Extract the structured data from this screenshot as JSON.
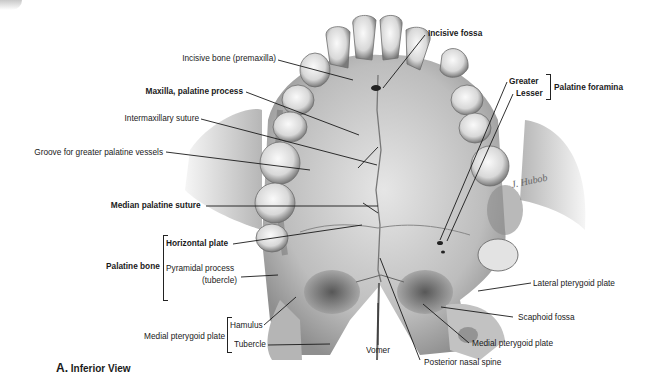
{
  "figure": {
    "caption_letter": "A.",
    "caption_text": "Inferior View",
    "signature": "J. Hubob"
  },
  "labels": {
    "incisive_bone": "Incisive bone (premaxilla)",
    "incisive_fossa": "Incisive fossa",
    "maxilla_palatine_process": "Maxilla, palatine process",
    "intermaxillary_suture": "Intermaxillary suture",
    "groove_greater_palatine": "Groove for greater palatine vessels",
    "palatine_foramina": {
      "group": "Palatine foramina",
      "greater": "Greater",
      "lesser": "Lesser"
    },
    "median_palatine_suture": "Median palatine suture",
    "palatine_bone": {
      "group": "Palatine bone",
      "horizontal_plate": "Horizontal plate",
      "pyramidal_process_1": "Pyramidal process",
      "pyramidal_process_2": "(tubercle)"
    },
    "medial_pterygoid_plate_group": {
      "group": "Medial pterygoid plate",
      "hamulus": "Hamulus",
      "tubercle": "Tubercle"
    },
    "vomer": "Vomer",
    "posterior_nasal_spine": "Posterior nasal spine",
    "medial_pterygoid_plate": "Medial pterygoid plate",
    "scaphoid_fossa": "Scaphoid fossa",
    "lateral_pterygoid_plate": "Lateral pterygoid plate"
  }
}
